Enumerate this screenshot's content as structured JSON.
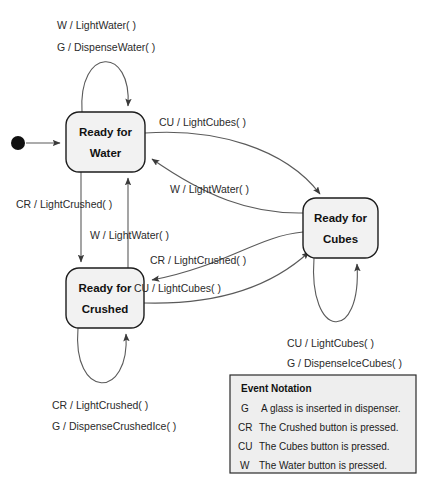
{
  "diagram": {
    "states": [
      {
        "id": "water",
        "label_line1": "Ready for",
        "label_line2": "Water"
      },
      {
        "id": "crushed",
        "label_line1": "Ready for",
        "label_line2": "Crushed"
      },
      {
        "id": "cubes",
        "label_line1": "Ready for",
        "label_line2": "Cubes"
      }
    ],
    "transitions": {
      "water_self_1": "W / LightWater( )",
      "water_self_2": "G / DispenseWater( )",
      "water_to_cubes": "CU / LightCubes( )",
      "cubes_to_water": "W / LightWater( )",
      "water_to_crushed": "CR / LightCrushed( )",
      "crushed_to_water": "W / LightWater( )",
      "cubes_to_crushed": "CR / LightCrushed( )",
      "crushed_to_cubes": "CU / LightCubes( )",
      "cubes_self_1": "CU / LightCubes( )",
      "cubes_self_2": "G / DispenseIceCubes( )",
      "crushed_self_1": "CR / LightCrushed( )",
      "crushed_self_2": "G / DispenseCrushedIce( )"
    }
  },
  "legend": {
    "title": "Event Notation",
    "entries": [
      {
        "key": "G",
        "description": "A glass is inserted in dispenser."
      },
      {
        "key": "CR",
        "description": "The Crushed button is pressed."
      },
      {
        "key": "CU",
        "description": "The Cubes button is pressed."
      },
      {
        "key": "W",
        "description": "The Water button is pressed."
      }
    ]
  },
  "colors": {
    "state_fill": "#f2f2f2",
    "state_stroke": "#1d1d1d",
    "edge_stroke": "#5a5a5a",
    "legend_fill": "#eeeeee",
    "background": "#ffffff"
  }
}
